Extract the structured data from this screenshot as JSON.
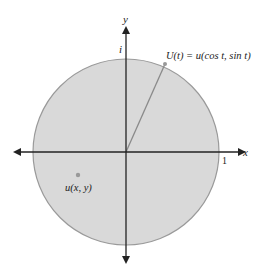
{
  "diagram": {
    "type": "unit-disk",
    "colors": {
      "disk_fill": "#d9d9d9",
      "disk_stroke": "#9a9a9a",
      "axis": "#222222",
      "radius_line": "#8a8a8a",
      "point": "#999999"
    },
    "axes": {
      "x_label": "x",
      "y_label": "y",
      "x_tick_label": "1",
      "y_tick_label": "i"
    },
    "labels": {
      "boundary_point": "U(t) = u(cos t, sin t)",
      "interior_point": "u(x, y)"
    }
  }
}
